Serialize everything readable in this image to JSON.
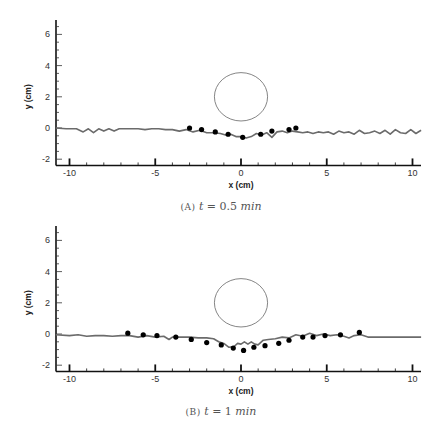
{
  "chart_data": [
    {
      "type": "line",
      "title": "",
      "caption": "(A) t = 0.5 min",
      "caption_parts": {
        "label": "(A)",
        "var": "t",
        "eq": "=",
        "value": "0.5",
        "unit": "min"
      },
      "xlabel": "x (cm)",
      "ylabel": "y (cm)",
      "xlim": [
        -10.8,
        10.5
      ],
      "ylim": [
        -2.4,
        6.9
      ],
      "xticks": [
        -10,
        -5,
        0,
        5,
        10
      ],
      "yticks": [
        -2,
        0,
        2,
        4,
        6
      ],
      "grid": false,
      "legend": null,
      "circle": {
        "cx": 0,
        "cy": 2.0,
        "r": 1.55
      },
      "series": [
        {
          "name": "simulation interface",
          "style": "line",
          "color": "#6b6b6b",
          "x": [
            -10.8,
            -10.2,
            -9.6,
            -9.2,
            -8.9,
            -8.6,
            -8.3,
            -8.0,
            -7.7,
            -7.4,
            -7.1,
            -6.8,
            -6.4,
            -6.0,
            -5.6,
            -5.2,
            -4.8,
            -4.4,
            -4.0,
            -3.6,
            -3.2,
            -2.8,
            -2.4,
            -2.0,
            -1.6,
            -1.2,
            -0.9,
            -0.6,
            -0.3,
            0.0,
            0.3,
            0.6,
            0.9,
            1.2,
            1.5,
            1.8,
            2.1,
            2.4,
            2.7,
            3.0,
            3.3,
            3.6,
            3.9,
            4.2,
            4.5,
            4.8,
            5.1,
            5.4,
            5.7,
            6.0,
            6.3,
            6.6,
            6.9,
            7.2,
            7.5,
            7.8,
            8.1,
            8.4,
            8.7,
            9.0,
            9.3,
            9.6,
            9.9,
            10.2,
            10.5
          ],
          "y": [
            0.0,
            -0.05,
            -0.05,
            -0.25,
            -0.05,
            -0.3,
            -0.05,
            -0.2,
            -0.05,
            -0.2,
            -0.05,
            -0.05,
            -0.05,
            -0.05,
            -0.1,
            -0.05,
            -0.05,
            -0.1,
            -0.1,
            -0.2,
            -0.1,
            -0.25,
            -0.15,
            -0.3,
            -0.3,
            -0.35,
            -0.45,
            -0.4,
            -0.55,
            -0.55,
            -0.65,
            -0.55,
            -0.35,
            -0.45,
            -0.3,
            -0.6,
            -0.25,
            -0.2,
            -0.3,
            -0.2,
            -0.25,
            -0.3,
            -0.25,
            -0.35,
            -0.25,
            -0.3,
            -0.25,
            -0.4,
            -0.2,
            -0.3,
            -0.25,
            -0.4,
            -0.15,
            -0.35,
            -0.3,
            -0.2,
            -0.35,
            -0.15,
            -0.4,
            -0.1,
            -0.3,
            -0.35,
            -0.1,
            -0.35,
            -0.15
          ]
        },
        {
          "name": "experimental points",
          "style": "marker",
          "color": "#000000",
          "x": [
            -3.0,
            -2.3,
            -1.5,
            -0.75,
            0.1,
            1.15,
            1.8,
            2.8,
            3.2
          ],
          "y": [
            0.0,
            -0.1,
            -0.25,
            -0.4,
            -0.6,
            -0.4,
            -0.2,
            -0.1,
            0.0
          ]
        }
      ]
    },
    {
      "type": "line",
      "title": "",
      "caption": "(B) t = 1 min",
      "caption_parts": {
        "label": "(B)",
        "var": "t",
        "eq": "=",
        "value": "1",
        "unit": "min"
      },
      "xlabel": "x (cm)",
      "ylabel": "y (cm)",
      "xlim": [
        -10.8,
        10.5
      ],
      "ylim": [
        -2.4,
        6.9
      ],
      "xticks": [
        -10,
        -5,
        0,
        5,
        10
      ],
      "yticks": [
        -2,
        0,
        2,
        4,
        6
      ],
      "grid": false,
      "legend": null,
      "circle": {
        "cx": 0,
        "cy": 2.0,
        "r": 1.55
      },
      "series": [
        {
          "name": "simulation interface",
          "style": "line",
          "color": "#6b6b6b",
          "x": [
            -10.8,
            -10.0,
            -9.5,
            -9.0,
            -8.5,
            -8.0,
            -7.5,
            -7.0,
            -6.5,
            -6.0,
            -5.5,
            -5.0,
            -4.5,
            -4.2,
            -4.0,
            -3.5,
            -3.0,
            -2.5,
            -2.0,
            -1.6,
            -1.3,
            -1.0,
            -0.7,
            -0.4,
            -0.2,
            0.0,
            0.2,
            0.4,
            0.6,
            0.8,
            1.0,
            1.3,
            1.6,
            2.0,
            2.4,
            2.8,
            3.2,
            3.6,
            4.0,
            4.4,
            4.8,
            5.2,
            5.6,
            6.0,
            6.3,
            6.6,
            7.0,
            7.4,
            8.0,
            9.0,
            10.0,
            10.5
          ],
          "y": [
            -0.05,
            -0.1,
            -0.05,
            -0.15,
            -0.1,
            -0.1,
            -0.15,
            -0.1,
            -0.1,
            -0.2,
            -0.1,
            -0.2,
            -0.15,
            -0.35,
            -0.2,
            -0.2,
            -0.2,
            -0.25,
            -0.25,
            -0.3,
            -0.5,
            -0.6,
            -0.85,
            -0.8,
            -0.6,
            -0.65,
            -0.5,
            -0.65,
            -0.5,
            -0.65,
            -0.7,
            -0.4,
            -0.35,
            -0.3,
            -0.2,
            -0.25,
            -0.05,
            -0.15,
            0.05,
            -0.1,
            0.0,
            -0.1,
            -0.05,
            -0.15,
            -0.25,
            -0.1,
            -0.05,
            -0.2,
            -0.2,
            -0.2,
            -0.2,
            -0.2
          ]
        },
        {
          "name": "experimental points",
          "style": "marker",
          "color": "#000000",
          "x": [
            -6.6,
            -5.7,
            -4.9,
            -3.8,
            -2.9,
            -2.0,
            -1.15,
            -0.45,
            0.15,
            0.75,
            1.4,
            2.2,
            2.8,
            3.6,
            4.2,
            4.9,
            5.8,
            6.9
          ],
          "y": [
            0.05,
            -0.05,
            -0.1,
            -0.2,
            -0.35,
            -0.55,
            -0.7,
            -0.9,
            -1.05,
            -0.85,
            -0.75,
            -0.6,
            -0.4,
            -0.2,
            -0.2,
            -0.1,
            -0.05,
            0.1
          ]
        }
      ]
    }
  ],
  "captions": {
    "a": {
      "label": "(A)",
      "var": "t",
      "eq": "=",
      "value": "0.5",
      "unit": "min"
    },
    "b": {
      "label": "(B)",
      "var": "t",
      "eq": "=",
      "value": "1",
      "unit": "min"
    }
  }
}
